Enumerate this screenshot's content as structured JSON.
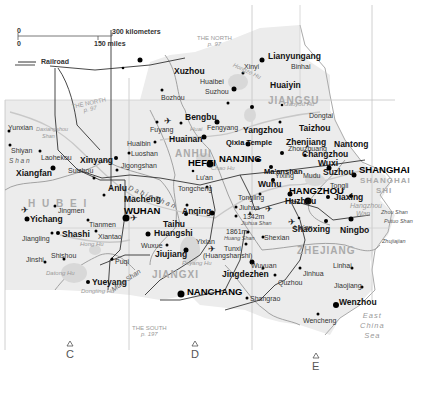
{
  "legend": {
    "scale_km_zero": "0",
    "scale_km_label": "300 kilometers",
    "scale_mi_zero": "0",
    "scale_mi_label": "150 miles",
    "railroad_label": "Railroad"
  },
  "provinces": {
    "jiangsu": "JIANGSU",
    "anhui": "ANHUI",
    "hubei": "H U B E I",
    "jiangxi": "JIANGXI",
    "zhejiang": "ZHEJIANG",
    "shanghai_shi_1": "SHANGHAI",
    "shanghai_shi_2": "SHI"
  },
  "cross_refs": {
    "north_top": {
      "title": "THE NORTH",
      "page": "p. 97"
    },
    "north_left": {
      "title": "THE NORTH",
      "page": "p. 97"
    },
    "south": {
      "title": "THE SOUTH",
      "page": "p. 197"
    }
  },
  "grid_letters": [
    "C",
    "D",
    "E"
  ],
  "cities_large": {
    "shanghai": "SHANGHAI",
    "nanjing": "NANJING",
    "hangzhou": "HANGZHOU",
    "hefei": "HEFEI",
    "wuhan": "WUHAN",
    "nanchang": "NANCHANG"
  },
  "cities_medium": {
    "lianyungang": "Lianyungang",
    "xuzhou": "Xuzhou",
    "huaiyin": "Huaiyin",
    "bengbu": "Bengbu",
    "huainan": "Huainan",
    "yangzhou": "Yangzhou",
    "zhenjiang": "Zhenjiang",
    "taizhou": "Taizhou",
    "nantong": "Nantong",
    "changzhou": "Changzhou",
    "wuxi": "Wuxi",
    "suzhou_js": "Suzhou",
    "jiaxing": "Jiaxing",
    "huzhou": "Huzhou",
    "shaoxing": "Shaoxing",
    "ningbo": "Ningbo",
    "wuhu": "Wuhu",
    "xinyang": "Xinyang",
    "xiangfan": "Xiangfan",
    "anlu": "Anlu",
    "macheng": "Macheng",
    "yichang": "Yichang",
    "shashi": "Shashi",
    "huangshi": "Huangshi",
    "taihu": "Taihu",
    "anqing": "Anqing",
    "jiujiang": "Jiujiang",
    "yueyang": "Yueyang",
    "jingdezhen": "Jingdezhen",
    "wenzhou": "Wenzhou",
    "qixia_temple": "Qixia Temple",
    "maanshan": "Ma'anshan"
  },
  "cities_small": {
    "xinyi": "Xinyi",
    "binhai": "Binhai",
    "huaibei": "Huaibei",
    "suzhou_ah": "Suzhou",
    "bozhou": "Bozhou",
    "dongtai": "Dongtai",
    "fuyang": "Fuyang",
    "fengyang": "Fengyang",
    "huaibin": "Huaibin",
    "luoshan": "Luoshan",
    "jigongshan": "Jigongshan",
    "luan": "Lu'an",
    "tongcheng": "Tongcheng",
    "zhouzhuang": "Zhouzhuang",
    "yixing": "Yixing",
    "mudu": "Mudu",
    "tongli": "Tongli",
    "yunxian": "Yunxian",
    "shiyan": "Shiyan",
    "laohekou": "Laohekou",
    "suizhou": "Suizhou",
    "jingmen": "Jingmen",
    "tianmen": "Tianmen",
    "xiantao": "Xiantao",
    "jiangling": "Jiangling",
    "jinshi": "Jinshi",
    "shishou": "Shishou",
    "puqi": "Puqi",
    "wuxue": "Wuxue",
    "tongling": "Tongling",
    "jiuhua": "Jiuhua",
    "shexian": "Shexian",
    "tunxi": "Tunxi",
    "tunxi_alt": "(Huangshanshi)",
    "yixian": "Yixian",
    "linan": "Lin'an",
    "wuyuan": "Wuyuan",
    "jinhua": "Jinhua",
    "linhai": "Linhai",
    "jiaojiang": "Jiaojiang",
    "quzhou": "Quzhou",
    "shangrao": "Shangrao",
    "wencheng": "Wencheng"
  },
  "mountains": {
    "jiuhua_height": "1342m",
    "jiuhua_name": "Jiuhua Shan",
    "huang_height": "1861m",
    "huang_name": "Huang Shan",
    "dabie_shan": "D a b i e   S h a n",
    "mufu_shan": "Mufu Shan",
    "daxiangshou_shan_1": "Daxiangshou",
    "daxiangshou_shan_2": "Shan",
    "shan_left": "S h a n",
    "zhou_shan": "Zhou Shan",
    "putuo_shan": "Putuo Shan",
    "zhujiajian": "Zhujiajian"
  },
  "water": {
    "hongze_hu": "Hongze Hu",
    "gaoyou_hu": "Gaoyou Hu",
    "chao_hu": "Chao Hu",
    "hong_hu": "Hong Hu",
    "dongting_hu": "Dongting Hu",
    "datong_hu": "Datong Hu",
    "poyang_hu": "Poyang Hu",
    "hangzhou_wan_1": "Hangzhou",
    "hangzhou_wan_2": "Wan",
    "huai_river": "Huai",
    "east_china_sea_1": "East",
    "east_china_sea_2": "China",
    "east_china_sea_3": "Sea"
  },
  "colors": {
    "land": "#ebebeb",
    "land_light": "#f4f4f4",
    "border": "#8a8a8a",
    "railroad": "#333333",
    "grid": "#bbbbbb",
    "water": "#d6d6d6",
    "river": "#c4c4c4"
  }
}
